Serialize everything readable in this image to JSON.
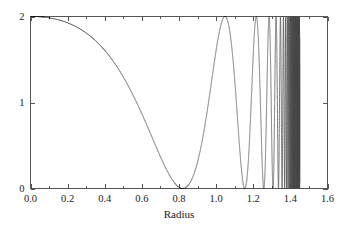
{
  "chart_data": {
    "type": "line",
    "title": "",
    "subtitle": "",
    "xlabel": "Radius",
    "ylabel": "",
    "xlim": [
      0.0,
      1.6
    ],
    "ylim": [
      0.0,
      2.0
    ],
    "grid": false,
    "legend": null,
    "x_ticks": [
      0.0,
      0.2,
      0.4,
      0.6,
      0.8,
      1.0,
      1.2,
      1.4,
      1.6
    ],
    "x_tick_labels": [
      "0.0",
      "0.2",
      "0.4",
      "0.6",
      "0.8",
      "1.0",
      "1.2",
      "1.4",
      "1.6"
    ],
    "y_ticks": [
      0,
      1,
      2
    ],
    "y_tick_labels": [
      "0",
      "1",
      "2"
    ],
    "x_minor_ticks": [
      0.1,
      0.3,
      0.5,
      0.7,
      0.9,
      1.1,
      1.3,
      1.5
    ],
    "series": [
      {
        "name": "radial envelope",
        "color": "#4a4a4a",
        "line_width": 0.75,
        "description": "Chirped oscillation: flat at 2 near r=0, first zero near r=0.82, then maxima of 2 with ever-shortening period, compressing toward r=1.45",
        "annotations": {
          "first_zero": 0.82,
          "first_peak_after_zero": 1.055,
          "second_zero": 1.165,
          "second_peak": 1.238,
          "third_zero": 1.278,
          "oscillation_end": 1.45,
          "plateau_value": 2.0
        },
        "x": [
          0.0,
          0.02,
          0.04,
          0.06,
          0.08,
          0.1,
          0.12,
          0.14,
          0.16,
          0.18,
          0.2,
          0.22,
          0.24,
          0.26,
          0.28,
          0.3,
          0.32,
          0.34,
          0.36,
          0.38,
          0.4,
          0.42,
          0.44,
          0.46,
          0.48,
          0.5,
          0.52,
          0.54,
          0.56,
          0.58,
          0.6,
          0.62,
          0.64,
          0.66,
          0.68,
          0.7,
          0.72,
          0.74,
          0.76,
          0.78,
          0.8,
          0.82,
          0.84,
          0.86,
          0.88,
          0.9,
          0.92,
          0.94,
          0.96,
          0.98,
          1.0,
          1.02,
          1.04,
          1.06,
          1.08,
          1.1,
          1.12,
          1.14,
          1.16,
          1.18,
          1.2,
          1.22,
          1.24,
          1.26,
          1.28,
          1.3,
          1.32,
          1.34,
          1.36,
          1.38,
          1.4,
          1.42,
          1.44,
          1.45
        ],
        "y": [
          2.0,
          2.0,
          2.0,
          2.0,
          1.999,
          1.999,
          1.998,
          1.996,
          1.994,
          1.991,
          1.986,
          1.98,
          1.972,
          1.961,
          1.947,
          1.929,
          1.906,
          1.878,
          1.844,
          1.803,
          1.755,
          1.699,
          1.635,
          1.563,
          1.483,
          1.395,
          1.3,
          1.199,
          1.093,
          0.983,
          0.871,
          0.759,
          0.648,
          0.54,
          0.438,
          0.343,
          0.257,
          0.182,
          0.12,
          0.07,
          0.03,
          0.002,
          0.008,
          0.07,
          0.2,
          0.39,
          0.63,
          0.9,
          1.19,
          1.47,
          1.71,
          1.89,
          1.98,
          2.0,
          1.93,
          1.76,
          1.45,
          0.95,
          0.33,
          0.12,
          0.9,
          1.7,
          1.99,
          1.5,
          0.18,
          0.55,
          1.95,
          1.1,
          0.05,
          1.8,
          1.6,
          0.3,
          1.9,
          0.2
        ]
      }
    ]
  },
  "axes": {
    "x_label": "Radius",
    "tick_label_0": "0.0",
    "tick_label_1": "0.2",
    "tick_label_2": "0.4",
    "tick_label_3": "0.6",
    "tick_label_4": "0.8",
    "tick_label_5": "1.0",
    "tick_label_6": "1.2",
    "tick_label_7": "1.4",
    "tick_label_8": "1.6",
    "y_label_0": "0",
    "y_label_1": "1",
    "y_label_2": "2"
  },
  "colors": {
    "curve": "#4a4a4a",
    "axis": "#555555",
    "text": "#1a1a1a",
    "background": "#ffffff"
  }
}
